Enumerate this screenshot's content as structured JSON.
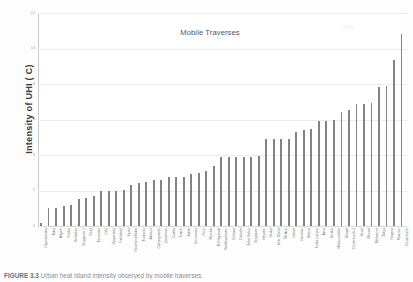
{
  "figure": {
    "caption_label": "FIGURE 3.3",
    "caption_text": "Urban heat island intensity observed by mobile traverses."
  },
  "chart_data": {
    "type": "bar",
    "title": "Mobile Traverses",
    "xlabel": "",
    "ylabel": "Intensity of UHI ( C)",
    "ylim": [
      0,
      12
    ],
    "yticks": [
      0,
      2,
      4,
      6,
      8,
      10,
      12
    ],
    "grid": true,
    "legend": false,
    "bar_color": "#838383",
    "categories": [
      "Higashiosaka",
      "Tokio",
      "Aligarh",
      "Fukiko",
      "Nerbadan",
      "Singapore-1",
      "Edad",
      "Tomonoto",
      "Lodz",
      "Vijayawada",
      "Fatihabad",
      "Kyoto",
      "Hiroshima/Sakai",
      "Tirukovilu",
      "Akitawa",
      "Campogrande",
      "Zacatecas",
      "Cuiaba",
      "Kozuh",
      "Jodah",
      "Kumamoto",
      "Pune",
      "Mumbai",
      "Tel Nagasaki",
      "Visakhapatnam",
      "Chibosa",
      "Calcutta",
      "Johor Bahru",
      "Singapore",
      "Hayashi",
      "Osaka",
      "Beer-Sheva",
      "Tel Aviv",
      "Hobart",
      "Honolulu",
      "Ottawa",
      "Kuala Lumpur",
      "Azua",
      "Jimaka",
      "Matsuura/Ube",
      "Bhopal",
      "Christchurch-2",
      "Seoul",
      "Muscat",
      "Melbourne",
      "Tokyo",
      "Nagano",
      "Moscow",
      "Christchurch"
    ],
    "values": [
      0.15,
      1.0,
      1.0,
      1.1,
      1.2,
      1.55,
      1.6,
      1.7,
      1.95,
      1.95,
      1.95,
      2.05,
      2.3,
      2.45,
      2.5,
      2.6,
      2.6,
      2.75,
      2.75,
      2.75,
      2.95,
      3.0,
      3.1,
      3.4,
      3.9,
      3.9,
      3.9,
      3.9,
      3.9,
      3.95,
      4.9,
      4.9,
      4.9,
      4.9,
      5.3,
      5.4,
      5.45,
      5.9,
      5.9,
      6.0,
      6.4,
      6.55,
      6.85,
      6.85,
      6.95,
      7.85,
      7.9,
      9.35,
      10.8
    ]
  },
  "watermark": {
    "text": "UHI"
  }
}
